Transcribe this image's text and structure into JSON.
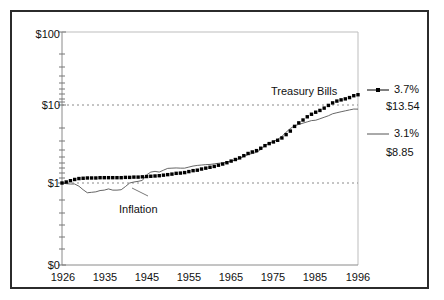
{
  "figure": {
    "background": "#ffffff",
    "frame_color": "#2b2b2b"
  },
  "chart_data": {
    "type": "line",
    "title": "",
    "xlabel": "",
    "ylabel": "",
    "scale": "log",
    "ylim": [
      1,
      100
    ],
    "xlim": [
      1926,
      1996
    ],
    "grid": "horizontal-dotted",
    "legend_position": "right",
    "ytick_labels": [
      "$100",
      "$10",
      "$1",
      "$0"
    ],
    "ytick_values": [
      100,
      10,
      1,
      0
    ],
    "xtick_labels": [
      "1926",
      "1935",
      "1945",
      "1955",
      "1965",
      "1975",
      "1985",
      "1996"
    ],
    "xtick_values": [
      1926,
      1935,
      1945,
      1955,
      1965,
      1975,
      1985,
      1996
    ],
    "annotations": [
      {
        "text": "Treasury Bills",
        "x": 1975,
        "y": 22
      },
      {
        "text": "Inflation",
        "x": 1941,
        "y": 0.62
      }
    ],
    "series": [
      {
        "name": "Treasury Bills",
        "legend_rate": "3.7%",
        "legend_value": "$13.54",
        "final_value": 13.54,
        "annual_return_pct": 3.7,
        "style": "dotted-markers",
        "color": "#000000",
        "x": [
          1926,
          1927,
          1928,
          1929,
          1930,
          1931,
          1932,
          1933,
          1934,
          1935,
          1936,
          1937,
          1938,
          1939,
          1940,
          1941,
          1942,
          1943,
          1944,
          1945,
          1946,
          1947,
          1948,
          1949,
          1950,
          1951,
          1952,
          1953,
          1954,
          1955,
          1956,
          1957,
          1958,
          1959,
          1960,
          1961,
          1962,
          1963,
          1964,
          1965,
          1966,
          1967,
          1968,
          1969,
          1970,
          1971,
          1972,
          1973,
          1974,
          1975,
          1976,
          1977,
          1978,
          1979,
          1980,
          1981,
          1982,
          1983,
          1984,
          1985,
          1986,
          1987,
          1988,
          1989,
          1990,
          1991,
          1992,
          1993,
          1994,
          1995,
          1996
        ],
        "values": [
          1.0,
          1.03,
          1.07,
          1.11,
          1.14,
          1.15,
          1.16,
          1.16,
          1.16,
          1.17,
          1.17,
          1.17,
          1.17,
          1.17,
          1.17,
          1.18,
          1.18,
          1.19,
          1.19,
          1.2,
          1.21,
          1.22,
          1.23,
          1.24,
          1.26,
          1.28,
          1.3,
          1.33,
          1.34,
          1.36,
          1.4,
          1.44,
          1.46,
          1.51,
          1.55,
          1.59,
          1.63,
          1.69,
          1.75,
          1.82,
          1.91,
          2.0,
          2.1,
          2.24,
          2.39,
          2.5,
          2.6,
          2.79,
          3.01,
          3.2,
          3.36,
          3.53,
          3.78,
          4.17,
          4.63,
          5.32,
          5.9,
          6.42,
          7.06,
          7.61,
          8.08,
          8.52,
          9.12,
          9.88,
          10.64,
          11.23,
          11.63,
          11.98,
          12.45,
          13.15,
          13.54
        ]
      },
      {
        "name": "Inflation",
        "legend_rate": "3.1%",
        "legend_value": "$8.85",
        "final_value": 8.85,
        "annual_return_pct": 3.1,
        "style": "thin-line",
        "color": "#555555",
        "x": [
          1926,
          1927,
          1928,
          1929,
          1930,
          1931,
          1932,
          1933,
          1934,
          1935,
          1936,
          1937,
          1938,
          1939,
          1940,
          1941,
          1942,
          1943,
          1944,
          1945,
          1946,
          1947,
          1948,
          1949,
          1950,
          1951,
          1952,
          1953,
          1954,
          1955,
          1956,
          1957,
          1958,
          1959,
          1960,
          1961,
          1962,
          1963,
          1964,
          1965,
          1966,
          1967,
          1968,
          1969,
          1970,
          1971,
          1972,
          1973,
          1974,
          1975,
          1976,
          1977,
          1978,
          1979,
          1980,
          1981,
          1982,
          1983,
          1984,
          1985,
          1986,
          1987,
          1988,
          1989,
          1990,
          1991,
          1992,
          1993,
          1994,
          1995,
          1996
        ],
        "values": [
          1.0,
          0.98,
          0.97,
          0.97,
          0.91,
          0.82,
          0.75,
          0.76,
          0.77,
          0.8,
          0.81,
          0.84,
          0.81,
          0.81,
          0.82,
          0.9,
          1.0,
          1.03,
          1.05,
          1.08,
          1.27,
          1.38,
          1.41,
          1.38,
          1.46,
          1.54,
          1.55,
          1.56,
          1.55,
          1.55,
          1.6,
          1.65,
          1.68,
          1.7,
          1.72,
          1.73,
          1.76,
          1.79,
          1.81,
          1.85,
          1.91,
          1.97,
          2.06,
          2.19,
          2.31,
          2.39,
          2.47,
          2.69,
          3.02,
          3.24,
          3.4,
          3.63,
          3.95,
          4.48,
          4.99,
          5.43,
          5.64,
          5.85,
          6.08,
          6.31,
          6.38,
          6.66,
          6.96,
          7.28,
          7.72,
          7.96,
          8.19,
          8.42,
          8.65,
          8.87,
          8.85
        ]
      }
    ]
  },
  "legend": {
    "entries": [
      {
        "rate": "3.7%",
        "value": "$13.54",
        "marker": "dotted-line-marker"
      },
      {
        "rate": "3.1%",
        "value": "$8.85",
        "marker": "plain-line-marker"
      }
    ]
  }
}
